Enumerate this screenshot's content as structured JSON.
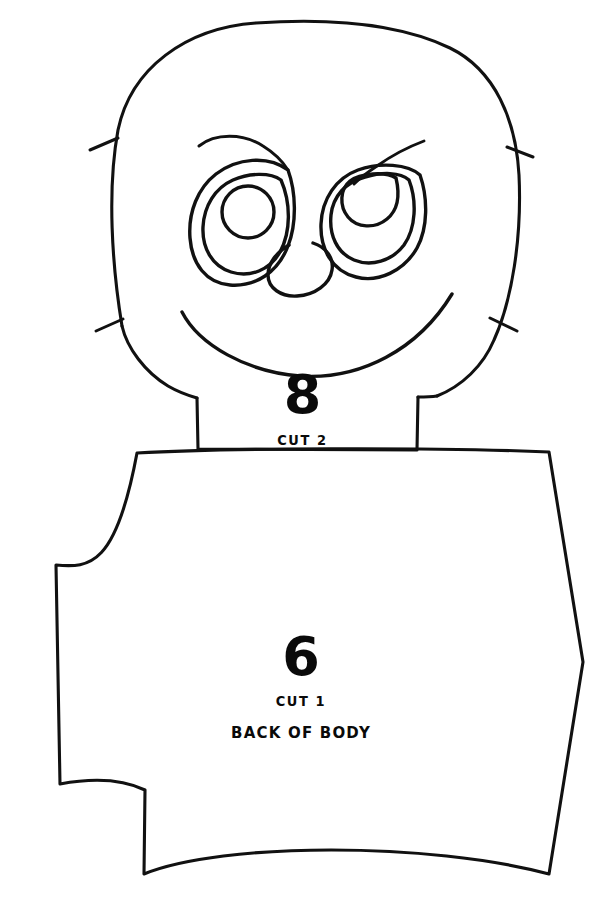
{
  "document": {
    "type": "sewing-pattern-sheet",
    "background_color": "#ffffff",
    "ink_color": "#111111"
  },
  "pieces": [
    {
      "id": "head",
      "number": "8",
      "cut_note": "CUT 2",
      "part_note": "",
      "description": "head-and-face-pattern-piece"
    },
    {
      "id": "body",
      "number": "6",
      "cut_note": "CUT 1",
      "part_note": "BACK OF BODY",
      "description": "back-of-body-pattern-piece"
    }
  ],
  "face": {
    "left_eye": "left-eye",
    "right_eye": "right-eye",
    "left_eyebrow": "left-eyebrow",
    "right_eyebrow": "right-eyebrow",
    "nose": "nose",
    "mouth": "smile-mouth"
  },
  "notches": {
    "count": 4,
    "labels": [
      "notch-upper-left",
      "notch-upper-right",
      "notch-lower-left",
      "notch-lower-right"
    ]
  }
}
